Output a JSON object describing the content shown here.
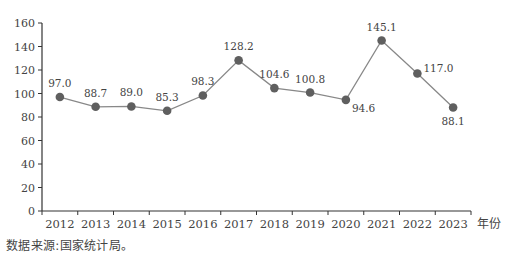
{
  "chart_data": {
    "type": "line",
    "title": "",
    "xlabel": "年份",
    "ylabel": "",
    "categories": [
      "2012",
      "2013",
      "2014",
      "2015",
      "2016",
      "2017",
      "2018",
      "2019",
      "2020",
      "2021",
      "2022",
      "2023"
    ],
    "series": [
      {
        "name": "",
        "values": [
          97.0,
          88.7,
          89.0,
          85.3,
          98.3,
          128.2,
          104.6,
          100.8,
          94.6,
          145.1,
          117.0,
          88.1
        ]
      }
    ],
    "data_labels": [
      "97.0",
      "88.7",
      "89.0",
      "85.3",
      "98.3",
      "128.2",
      "104.6",
      "100.8",
      "94.6",
      "145.1",
      "117.0",
      "88.1"
    ],
    "ylim": [
      0,
      160
    ],
    "yticks": [
      0,
      20,
      40,
      60,
      80,
      100,
      120,
      140,
      160
    ],
    "grid": false,
    "legend": "none",
    "colors": {
      "line": "#888888",
      "marker": "#5f5f5f",
      "axis": "#333333"
    }
  },
  "source_note": "数据来源:国家统计局。"
}
